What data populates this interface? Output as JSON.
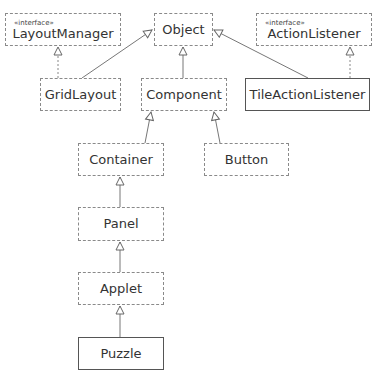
{
  "diagram": {
    "type": "uml-class-diagram",
    "classes": {
      "layout_manager": {
        "name": "LayoutManager",
        "stereotype": "«interface»",
        "border": "dashed"
      },
      "object": {
        "name": "Object",
        "border": "dashed"
      },
      "action_listener": {
        "name": "ActionListener",
        "stereotype": "«interface»",
        "border": "dashed"
      },
      "grid_layout": {
        "name": "GridLayout",
        "border": "dashed"
      },
      "component": {
        "name": "Component",
        "border": "dashed"
      },
      "tile_action_listener": {
        "name": "TileActionListener",
        "border": "solid"
      },
      "container": {
        "name": "Container",
        "border": "dashed"
      },
      "button": {
        "name": "Button",
        "border": "dashed"
      },
      "panel": {
        "name": "Panel",
        "border": "dashed"
      },
      "applet": {
        "name": "Applet",
        "border": "dashed"
      },
      "puzzle": {
        "name": "Puzzle",
        "border": "solid"
      }
    },
    "relations": [
      {
        "from": "GridLayout",
        "to": "LayoutManager",
        "kind": "realization"
      },
      {
        "from": "GridLayout",
        "to": "Object",
        "kind": "generalization"
      },
      {
        "from": "Component",
        "to": "Object",
        "kind": "generalization"
      },
      {
        "from": "TileActionListener",
        "to": "Object",
        "kind": "generalization"
      },
      {
        "from": "TileActionListener",
        "to": "ActionListener",
        "kind": "realization"
      },
      {
        "from": "Container",
        "to": "Component",
        "kind": "generalization"
      },
      {
        "from": "Button",
        "to": "Component",
        "kind": "generalization"
      },
      {
        "from": "Panel",
        "to": "Container",
        "kind": "generalization"
      },
      {
        "from": "Applet",
        "to": "Panel",
        "kind": "generalization"
      },
      {
        "from": "Puzzle",
        "to": "Applet",
        "kind": "generalization"
      }
    ],
    "colors": {
      "line": "#777777",
      "dashed_border": "#8a8a8a",
      "solid_border": "#555555",
      "text": "#333333"
    }
  }
}
